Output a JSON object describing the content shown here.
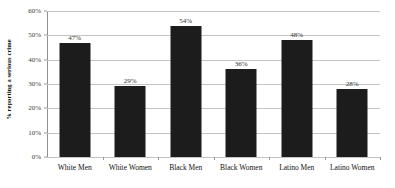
{
  "chart_data": {
    "type": "bar",
    "title": "",
    "xlabel": "",
    "ylabel": "% reporting a serious crime",
    "categories": [
      "White Men",
      "White Women",
      "Black Men",
      "Black Women",
      "Latino Men",
      "Latino Women"
    ],
    "values": [
      47,
      29,
      54,
      36,
      48,
      28
    ],
    "data_labels": [
      "47%",
      "29%",
      "54%",
      "36%",
      "48%",
      "28%"
    ],
    "ylim": [
      0,
      60
    ],
    "ytick_values": [
      0,
      10,
      20,
      30,
      40,
      50,
      60
    ],
    "ytick_labels": [
      "0%",
      "10%",
      "20%",
      "30%",
      "40%",
      "50%",
      "60%"
    ],
    "grid": true,
    "legend": false,
    "legend_position": "none",
    "bar_color": "#1c1c1c",
    "gridline_color": "#c4c4c4",
    "axis_color": "#8f8f8f",
    "background_color": "#ffffff"
  }
}
